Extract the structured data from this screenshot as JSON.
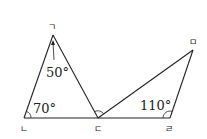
{
  "diagram": {
    "vertices": {
      "A": {
        "label": "ㄱ"
      },
      "B": {
        "label": "ㄴ"
      },
      "C": {
        "label": "ㄷ"
      },
      "D": {
        "label": "ㄹ"
      },
      "E": {
        "label": "ㅁ"
      }
    },
    "angles": {
      "apex": {
        "label": "50°",
        "vertex": "ㄱ",
        "value_deg": 50
      },
      "left_base": {
        "label": "70°",
        "vertex": "ㄴ",
        "value_deg": 70
      },
      "right_base": {
        "label": "110°",
        "vertex": "ㄹ",
        "value_deg": 110
      }
    },
    "segments": [
      "ㄱㄴ",
      "ㄱㄷ",
      "ㄴㄷ",
      "ㄷㄹ",
      "ㄷㅁ",
      "ㄹㅁ"
    ],
    "colors": {
      "stroke": "#222222",
      "background": "#ffffff"
    }
  }
}
